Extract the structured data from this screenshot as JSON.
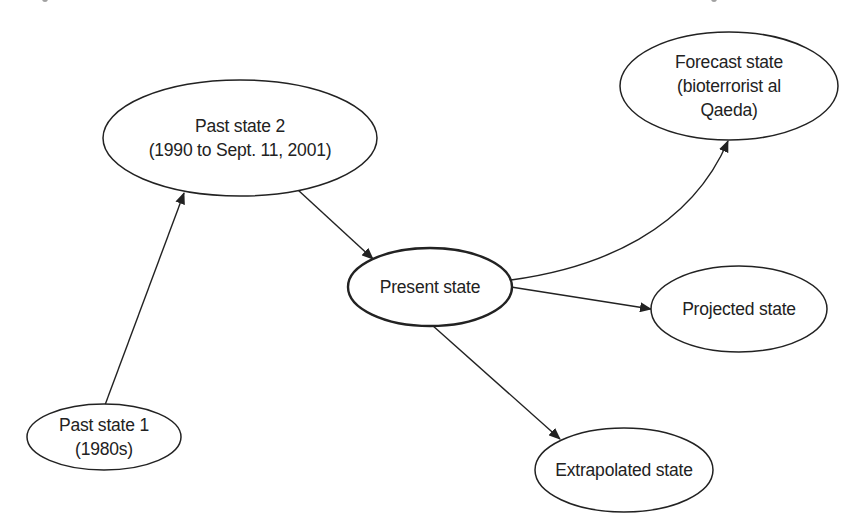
{
  "diagram": {
    "type": "state-transition diagram",
    "colors": {
      "background": "#ffffff",
      "stroke": "#222222",
      "text": "#222222"
    },
    "nodes": [
      {
        "id": "past1",
        "lines": [
          "Past state 1",
          "(1980s)"
        ],
        "cx": 104,
        "cy": 437,
        "rx": 77,
        "ry": 33,
        "emphasis": false
      },
      {
        "id": "past2",
        "lines": [
          "Past state 2",
          "(1990 to Sept. 11, 2001)"
        ],
        "cx": 240,
        "cy": 138,
        "rx": 137,
        "ry": 58,
        "emphasis": false
      },
      {
        "id": "present",
        "lines": [
          "Present state"
        ],
        "cx": 430,
        "cy": 287,
        "rx": 82,
        "ry": 39,
        "emphasis": true
      },
      {
        "id": "forecast",
        "lines": [
          "Forecast state",
          "(bioterrorist al",
          "Qaeda)"
        ],
        "cx": 729,
        "cy": 86,
        "rx": 109,
        "ry": 54,
        "emphasis": false
      },
      {
        "id": "projected",
        "lines": [
          "Projected state"
        ],
        "cx": 739,
        "cy": 309,
        "rx": 88,
        "ry": 43,
        "emphasis": false
      },
      {
        "id": "extrapolated",
        "lines": [
          "Extrapolated state"
        ],
        "cx": 624,
        "cy": 470,
        "rx": 89,
        "ry": 42,
        "emphasis": false
      }
    ],
    "edges": [
      {
        "from": "past1",
        "to": "past2",
        "shape": "straight"
      },
      {
        "from": "past2",
        "to": "present",
        "shape": "straight"
      },
      {
        "from": "present",
        "to": "forecast",
        "shape": "curved"
      },
      {
        "from": "present",
        "to": "projected",
        "shape": "straight"
      },
      {
        "from": "present",
        "to": "extrapolated",
        "shape": "straight"
      }
    ]
  }
}
